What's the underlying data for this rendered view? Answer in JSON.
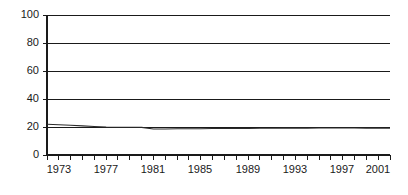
{
  "chart_data": {
    "type": "line",
    "title": "",
    "subtitle": "",
    "xlabel": "",
    "ylabel": "",
    "xlim": [
      1973,
      2002
    ],
    "ylim": [
      0,
      100
    ],
    "grid": true,
    "legend": false,
    "y_ticks": [
      0,
      20,
      40,
      60,
      80,
      100
    ],
    "y_tick_labels": [
      "0",
      "20",
      "40",
      "60",
      "80",
      "100"
    ],
    "x_ticks": [
      1973,
      1974,
      1975,
      1976,
      1977,
      1978,
      1979,
      1980,
      1981,
      1982,
      1983,
      1984,
      1985,
      1986,
      1987,
      1988,
      1989,
      1990,
      1991,
      1992,
      1993,
      1994,
      1995,
      1996,
      1997,
      1998,
      1999,
      2000,
      2001,
      2002
    ],
    "x_tick_labels": [
      "1973",
      "1977",
      "1981",
      "1985",
      "1989",
      "1993",
      "1997",
      "2001"
    ],
    "x_labeled_ticks": [
      1973,
      1977,
      1981,
      1985,
      1989,
      1993,
      1997,
      2001
    ],
    "series": [
      {
        "name": "series-1",
        "color": "#2b2b2b",
        "x": [
          1973,
          1974,
          1975,
          1976,
          1977,
          1978,
          1979,
          1980,
          1981,
          1982,
          1983,
          1984,
          1985,
          1986,
          1987,
          1988,
          1989,
          1990,
          1991,
          1992,
          1993,
          1994,
          1995,
          1996,
          1997,
          1998,
          1999,
          2000,
          2001,
          2002
        ],
        "values": [
          22.0,
          21.6,
          21.2,
          20.8,
          20.4,
          20.0,
          19.8,
          19.8,
          19.7,
          18.6,
          18.6,
          18.7,
          18.8,
          18.8,
          18.9,
          18.9,
          19.0,
          19.0,
          19.1,
          19.1,
          19.2,
          19.2,
          19.2,
          19.3,
          19.3,
          19.3,
          19.3,
          19.2,
          19.2,
          19.1
        ]
      }
    ]
  },
  "yticks": {
    "t0": "0",
    "t20": "20",
    "t40": "40",
    "t60": "60",
    "t80": "80",
    "t100": "100"
  },
  "xticks": {
    "t1973": "1973",
    "t1977": "1977",
    "t1981": "1981",
    "t1985": "1985",
    "t1989": "1989",
    "t1993": "1993",
    "t1997": "1997",
    "t2001": "2001"
  },
  "colors": {
    "series": "#2b2b2b",
    "axis": "#1a1a1a",
    "grid": "#1a1a1a",
    "background": "#ffffff"
  }
}
